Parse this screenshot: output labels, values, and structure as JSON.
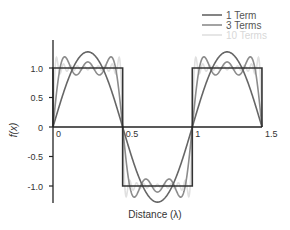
{
  "chart_data": {
    "type": "line",
    "title": "",
    "xlabel": "Distance (λ)",
    "ylabel": "f(x)",
    "xlim": [
      0,
      1.5
    ],
    "ylim": [
      -1.3,
      1.3
    ],
    "x_ticks": [
      {
        "value": 0,
        "label": "0"
      },
      {
        "value": 0.5,
        "label": "0.5"
      },
      {
        "value": 1,
        "label": "1"
      },
      {
        "value": 1.5,
        "label": "1.5"
      }
    ],
    "y_ticks": [
      {
        "value": 1.0,
        "label": "1.0"
      },
      {
        "value": 0.5,
        "label": "0.5"
      },
      {
        "value": 0,
        "label": "0"
      },
      {
        "value": -0.5,
        "label": "-0.5"
      },
      {
        "value": -1.0,
        "label": "-1.0"
      }
    ],
    "grid": false,
    "legend_position": "top-right",
    "square_wave": {
      "name": "Square wave",
      "period": 1.0,
      "amplitude": 1.0,
      "color": "#333333",
      "points": [
        [
          0,
          0
        ],
        [
          0,
          1
        ],
        [
          0.5,
          1
        ],
        [
          0.5,
          -1
        ],
        [
          1,
          -1
        ],
        [
          1,
          1
        ],
        [
          1.5,
          1
        ],
        [
          1.5,
          0
        ]
      ]
    },
    "series": [
      {
        "name": "1 Term",
        "terms": 1,
        "color": "#666666",
        "peak": 1.27
      },
      {
        "name": "3 Terms",
        "terms": 3,
        "color": "#8c8c8c",
        "peak": 1.17
      },
      {
        "name": "10 Terms",
        "terms": 10,
        "color": "#e0e0e0",
        "peak": 1.09
      }
    ]
  }
}
